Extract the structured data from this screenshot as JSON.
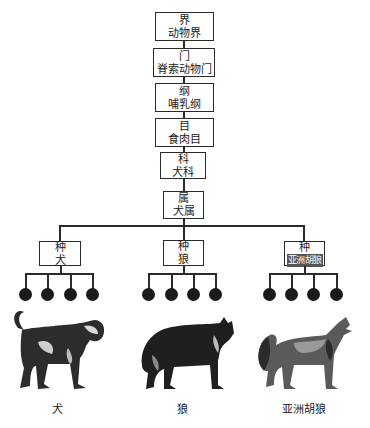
{
  "ranks": [
    {
      "rank": "界",
      "name": "动物界"
    },
    {
      "rank": "门",
      "name": "脊索动物门"
    },
    {
      "rank": "纲",
      "name": "哺乳纲"
    },
    {
      "rank": "目",
      "name": "食肉目"
    },
    {
      "rank": "科",
      "name": "犬科"
    },
    {
      "rank": "属",
      "name": "犬属"
    }
  ],
  "species": [
    {
      "rank": "种",
      "name": "犬",
      "caption": "犬",
      "animal_icon": "dog-illustration"
    },
    {
      "rank": "种",
      "name": "狼",
      "caption": "狼",
      "animal_icon": "wolf-illustration"
    },
    {
      "rank": "种",
      "name": "亚洲胡狼",
      "caption": "亚洲胡狼",
      "animal_icon": "jackal-illustration"
    }
  ],
  "subspecies_per_species": 4
}
